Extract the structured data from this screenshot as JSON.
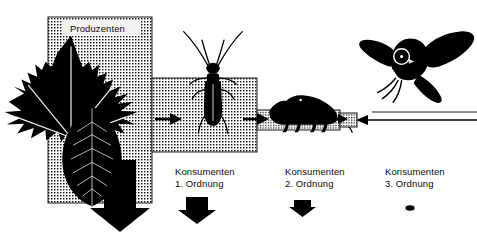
{
  "diagram": {
    "title_label": "Produzenten",
    "language": "de",
    "levels": [
      {
        "id": "produzenten",
        "label": "Produzenten",
        "label_line1": "Produzenten",
        "label_line2": "",
        "organisms": [
          "maple-leaf",
          "beech-leaf"
        ],
        "box": {
          "x": 48,
          "y": 17,
          "w": 104,
          "h": 186
        },
        "loss_arrow": {
          "x": 100,
          "y": 196,
          "w": 42,
          "h": 36
        }
      },
      {
        "id": "konsumenten-1",
        "label": "Konsumenten 1. Ordnung",
        "label_line1": "Konsumenten",
        "label_line2": "1. Ordnung",
        "organisms": [
          "longhorn-beetle"
        ],
        "box": {
          "x": 152,
          "y": 78,
          "w": 105,
          "h": 74
        },
        "loss_arrow": {
          "x": 192,
          "y": 200,
          "w": 26,
          "h": 22
        }
      },
      {
        "id": "konsumenten-2",
        "label": "Konsumenten 2. Ordnung",
        "label_line1": "Konsumenten",
        "label_line2": "2. Ordnung",
        "organisms": [
          "shrew"
        ],
        "box": {
          "x": 257,
          "y": 110,
          "w": 83,
          "h": 20
        },
        "loss_arrow": {
          "x": 300,
          "y": 203,
          "w": 15,
          "h": 12
        }
      },
      {
        "id": "konsumenten-3",
        "label": "Konsumenten 3. Ordnung",
        "label_line1": "Konsumenten",
        "label_line2": "3. Ordnung",
        "organisms": [
          "owl"
        ],
        "box": {
          "x": 340,
          "y": 113,
          "w": 17,
          "h": 14
        },
        "loss_arrow": {
          "x": 407,
          "y": 206,
          "w": 7,
          "h": 5
        }
      }
    ],
    "flow_arrows": [
      {
        "id": "flow-1",
        "from": "produzenten",
        "to": "konsumenten-1",
        "direction": "right"
      },
      {
        "id": "flow-2",
        "from": "konsumenten-1",
        "to": "konsumenten-2",
        "direction": "right"
      },
      {
        "id": "flow-3",
        "from": "konsumenten-2",
        "to": "konsumenten-3",
        "direction": "right"
      },
      {
        "id": "flow-4",
        "from": "konsumenten-3",
        "to": "outflow",
        "direction": "left"
      }
    ],
    "colors": {
      "ink": "#000000",
      "background": "#ffffff",
      "halftone_fill": "#d8d8d8",
      "outline": "#1a1a1a"
    }
  }
}
